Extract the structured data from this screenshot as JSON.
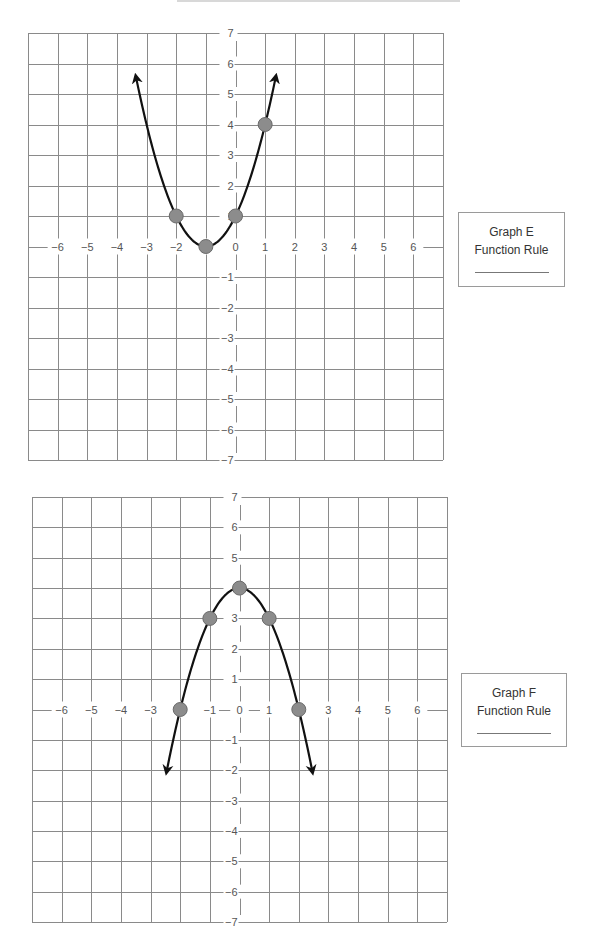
{
  "chart_data": [
    {
      "type": "line",
      "title": "Graph E",
      "label_box": {
        "title": "Graph E",
        "subtitle": "Function Rule",
        "answer": ""
      },
      "xlim": [
        -7,
        7
      ],
      "ylim": [
        -7,
        7
      ],
      "grid": true,
      "x_tick_labels": [
        "-6",
        "-5",
        "-4",
        "-3",
        "-2",
        "-1",
        "0",
        "1",
        "2",
        "3",
        "4",
        "5",
        "6"
      ],
      "y_tick_labels": [
        "7",
        "6",
        "5",
        "4",
        "3",
        "2",
        "1",
        "-1",
        "-2",
        "-3",
        "-4",
        "-5",
        "-6",
        "-7"
      ],
      "points": [
        [
          -2,
          1
        ],
        [
          -1,
          0
        ],
        [
          0,
          1
        ],
        [
          1,
          4
        ]
      ],
      "curve": "y = (x + 1)^2",
      "arrows": {
        "left_end": [
          -3.35,
          6.6
        ],
        "right_end": [
          1.35,
          6.6
        ]
      }
    },
    {
      "type": "line",
      "title": "Graph F",
      "label_box": {
        "title": "Graph F",
        "subtitle": "Function Rule",
        "answer": ""
      },
      "xlim": [
        -7,
        7
      ],
      "ylim": [
        -7,
        7
      ],
      "grid": true,
      "x_tick_labels": [
        "-6",
        "-5",
        "-4",
        "-3",
        "-2",
        "-1",
        "0",
        "1",
        "2",
        "3",
        "4",
        "5",
        "6"
      ],
      "y_tick_labels": [
        "7",
        "6",
        "5",
        "4",
        "3",
        "2",
        "1",
        "-1",
        "-2",
        "-3",
        "-4",
        "-5",
        "-6",
        "-7"
      ],
      "points": [
        [
          -2,
          0
        ],
        [
          -1,
          3
        ],
        [
          0,
          4
        ],
        [
          1,
          3
        ],
        [
          2,
          0
        ]
      ],
      "curve": "y = 4 - x^2",
      "arrows": {
        "left_end": [
          -2.45,
          -2.85
        ],
        "right_end": [
          2.45,
          -2.6
        ]
      }
    }
  ],
  "graphs": [
    {
      "id": "E",
      "box": {
        "left": 28,
        "top": 33,
        "width": 415,
        "height": 427
      },
      "label_box": {
        "left": 458,
        "top": 212,
        "width": 107,
        "height": 75
      }
    },
    {
      "id": "F",
      "box": {
        "left": 32,
        "top": 497,
        "width": 415,
        "height": 425
      },
      "label_box": {
        "left": 461,
        "top": 673,
        "width": 106,
        "height": 74
      }
    }
  ],
  "colors": {
    "grid": "#8a8a8a",
    "curve": "#111111",
    "point_fill": "#8c8c8c",
    "point_stroke": "#6a6a6a",
    "label": "#555555"
  }
}
